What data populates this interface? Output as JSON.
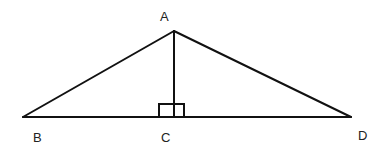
{
  "diagram": {
    "type": "geometry",
    "stroke_color": "#111111",
    "points": {
      "A": {
        "label": "A",
        "x": 174,
        "y": 31
      },
      "B": {
        "label": "B",
        "x": 23,
        "y": 117
      },
      "C": {
        "label": "C",
        "x": 174,
        "y": 117
      },
      "D": {
        "label": "D",
        "x": 351,
        "y": 117
      }
    },
    "segments": [
      "AB",
      "AD",
      "BD",
      "AC"
    ],
    "right_angle_marker": {
      "at": "C",
      "description": "right angle markers on both sides of AC at C"
    }
  }
}
